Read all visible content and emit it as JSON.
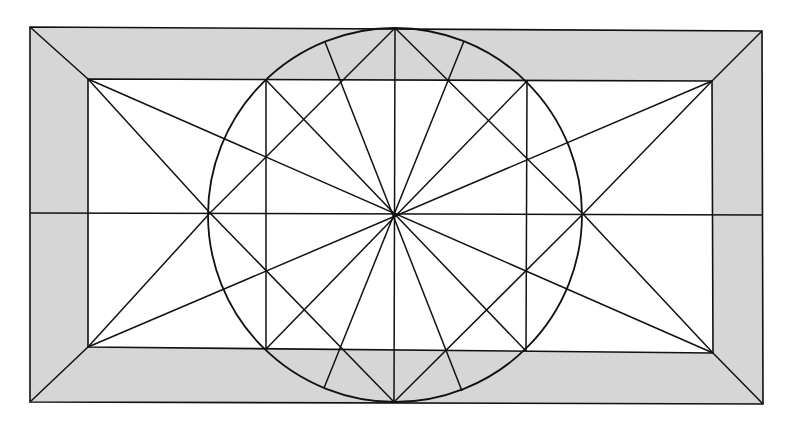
{
  "diagram": {
    "type": "geometric-construction",
    "colors": {
      "background": "#ffffff",
      "frame_fill": "#d6d6d6",
      "inner_fill": "#ffffff",
      "stroke": "#111111"
    },
    "outer_rect": {
      "tl": [
        30,
        27
      ],
      "tr": [
        762,
        31
      ],
      "br": [
        763,
        404
      ],
      "bl": [
        30,
        402
      ]
    },
    "inner_rect": {
      "tl": [
        88,
        79
      ],
      "tr": [
        712,
        81
      ],
      "br": [
        713,
        353
      ],
      "bl": [
        88,
        347
      ]
    },
    "circle": {
      "cx": 395,
      "cy": 215,
      "r": 187
    },
    "center": [
      395,
      214
    ],
    "key_points": {
      "circle_left": [
        210,
        213
      ],
      "circle_right": [
        583,
        214
      ],
      "circle_top": [
        395,
        28
      ],
      "circle_bottom": [
        394,
        402
      ],
      "inner_top_left_on_circle": [
        266,
        80
      ],
      "inner_top_right_on_circle": [
        527,
        81
      ],
      "inner_bottom_left_on_circle": [
        266,
        349
      ],
      "inner_bottom_right_on_circle": [
        526,
        351
      ],
      "top_left_arc_point": [
        325,
        42
      ],
      "top_right_arc_point": [
        464,
        41
      ],
      "bottom_left_arc_point": [
        324,
        388
      ],
      "bottom_right_arc_point": [
        462,
        391
      ]
    },
    "lines": [
      {
        "name": "corner-tl",
        "from": [
          30,
          27
        ],
        "to": [
          88,
          79
        ]
      },
      {
        "name": "corner-tr",
        "from": [
          762,
          31
        ],
        "to": [
          712,
          81
        ]
      },
      {
        "name": "corner-bl",
        "from": [
          30,
          402
        ],
        "to": [
          88,
          347
        ]
      },
      {
        "name": "corner-br",
        "from": [
          763,
          404
        ],
        "to": [
          713,
          353
        ]
      },
      {
        "name": "horizontal-axis",
        "from": [
          30,
          213
        ],
        "to": [
          763,
          215
        ]
      },
      {
        "name": "vertical-axis",
        "from": [
          395,
          28
        ],
        "to": [
          394,
          402
        ]
      },
      {
        "name": "vertical-left",
        "from": [
          266,
          80
        ],
        "to": [
          266,
          349
        ]
      },
      {
        "name": "vertical-right",
        "from": [
          527,
          81
        ],
        "to": [
          526,
          351
        ]
      },
      {
        "name": "diag-inner-tl-br",
        "from": [
          88,
          79
        ],
        "to": [
          713,
          353
        ]
      },
      {
        "name": "diag-inner-tr-bl",
        "from": [
          712,
          81
        ],
        "to": [
          88,
          347
        ]
      },
      {
        "name": "inner-tl-to-circle-left",
        "from": [
          88,
          79
        ],
        "to": [
          210,
          213
        ]
      },
      {
        "name": "inner-bl-to-circle-left",
        "from": [
          88,
          347
        ],
        "to": [
          210,
          213
        ]
      },
      {
        "name": "inner-tr-to-circle-right",
        "from": [
          712,
          81
        ],
        "to": [
          583,
          214
        ]
      },
      {
        "name": "inner-br-to-circle-right",
        "from": [
          713,
          353
        ],
        "to": [
          583,
          214
        ]
      },
      {
        "name": "left-to-top",
        "from": [
          210,
          213
        ],
        "to": [
          395,
          28
        ]
      },
      {
        "name": "left-to-bottom",
        "from": [
          210,
          213
        ],
        "to": [
          394,
          402
        ]
      },
      {
        "name": "right-to-top",
        "from": [
          583,
          214
        ],
        "to": [
          395,
          28
        ]
      },
      {
        "name": "right-to-bottom",
        "from": [
          583,
          214
        ],
        "to": [
          394,
          402
        ]
      },
      {
        "name": "radial-tl-inner",
        "from": [
          266,
          80
        ],
        "to": [
          526,
          351
        ]
      },
      {
        "name": "radial-tr-inner",
        "from": [
          527,
          81
        ],
        "to": [
          266,
          349
        ]
      },
      {
        "name": "radial-top-left-arc",
        "from": [
          325,
          42
        ],
        "to": [
          462,
          391
        ]
      },
      {
        "name": "radial-top-right-arc",
        "from": [
          464,
          41
        ],
        "to": [
          324,
          388
        ]
      }
    ]
  }
}
